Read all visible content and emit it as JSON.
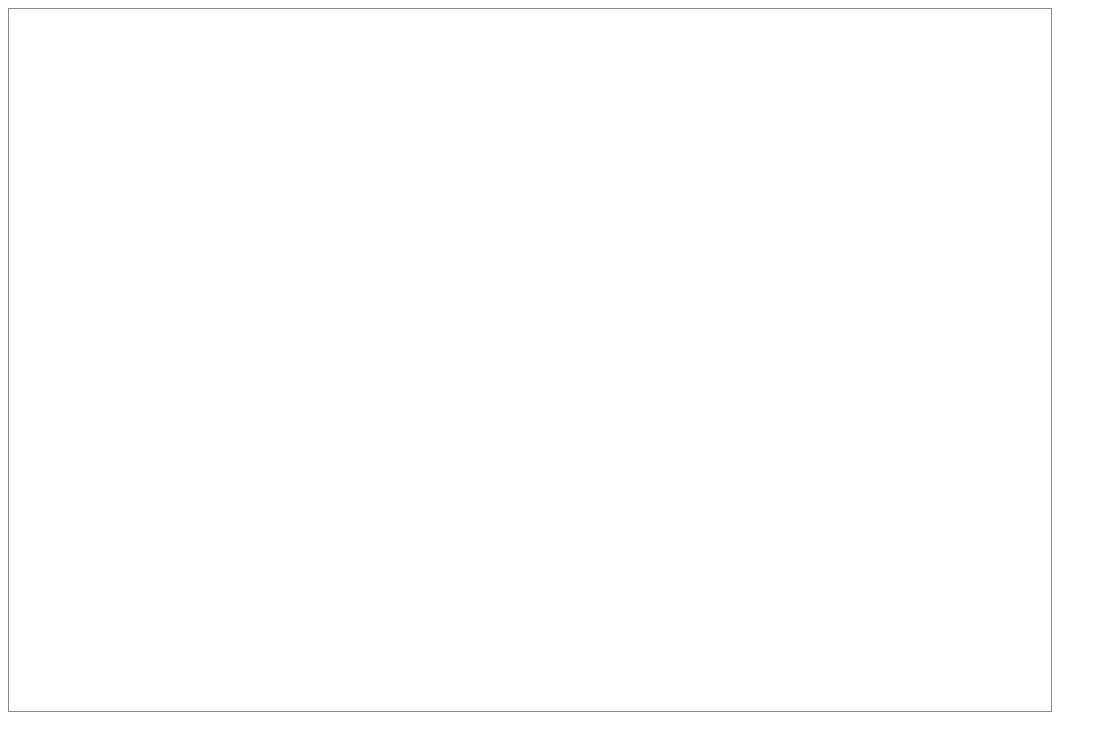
{
  "chart_data": {
    "type": "line",
    "title": "",
    "xlabel": "Prevalence or pre-test probability",
    "ylabel": "",
    "xlim": [
      0,
      100
    ],
    "ylim": [
      0,
      100
    ],
    "grid": true,
    "legend_position": "center",
    "x_ticks": [
      "0%",
      "10%",
      "20%",
      "30%",
      "40%",
      "50%",
      "60%",
      "70%",
      "80%",
      "90%",
      "100%"
    ],
    "x_tick_values": [
      0,
      10,
      20,
      30,
      40,
      50,
      60,
      70,
      80,
      90,
      100
    ],
    "y_ticks": [
      "0%",
      "10%",
      "20%",
      "30%",
      "40%",
      "50%",
      "60%",
      "70%",
      "80%",
      "90%",
      "100%"
    ],
    "y_tick_values": [
      0,
      10,
      20,
      30,
      40,
      50,
      60,
      70,
      80,
      90,
      100
    ],
    "x": [
      1,
      5,
      10,
      15,
      20,
      25,
      30,
      35,
      40,
      45,
      50,
      55,
      60,
      65,
      70,
      75,
      80,
      85,
      90,
      95,
      99
    ],
    "series": [
      {
        "name": "PPV",
        "marker": "circle",
        "color": "#6f6f6f",
        "values": [
          3.0,
          14.6,
          26.5,
          36.5,
          44.6,
          52.0,
          58.4,
          63.6,
          68.4,
          72.6,
          76.4,
          79.8,
          83.2,
          86.3,
          88.6,
          91.0,
          93.0,
          95.0,
          96.7,
          98.3,
          99.6
        ]
      },
      {
        "name": "NPV",
        "marker": "square",
        "color": "#1c1c1c",
        "values": [
          99.7,
          99.3,
          98.9,
          98.4,
          97.7,
          97.1,
          96.4,
          95.6,
          94.7,
          93.5,
          92.2,
          90.6,
          90.4,
          88.1,
          86.0,
          82.4,
          77.8,
          71.5,
          61.0,
          42.8,
          12.4
        ]
      },
      {
        "name": "'Accuracy'",
        "marker": "dotted",
        "color": "#111111",
        "values": [
          71.3,
          71.8,
          72.4,
          73.0,
          73.7,
          74.5,
          75.5,
          76.6,
          77.8,
          79.1,
          80.4,
          81.6,
          82.8,
          84.0,
          85.2,
          86.4,
          87.7,
          89.2,
          90.9,
          92.7,
          94.5
        ]
      }
    ],
    "annotations": [
      {
        "type": "down-arrow",
        "x": 75,
        "y_top": 91.0,
        "label": ""
      },
      {
        "type": "down-arrow",
        "x": 85,
        "y_top": 91.5,
        "label": ""
      }
    ]
  },
  "legend": {
    "items": [
      {
        "label": "PPV",
        "marker": "circle"
      },
      {
        "label": "NPV",
        "marker": "square"
      },
      {
        "label": "'Accuracy'",
        "marker": "dotted"
      }
    ]
  },
  "axis": {
    "x_title": "Prevalence or pre-test probability"
  }
}
